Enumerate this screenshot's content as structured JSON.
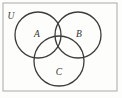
{
  "figure": {
    "kind": "venn-diagram",
    "title": "",
    "background_color": "#fdfdfb",
    "frame": {
      "label": "U",
      "label_name": "universal-set-label",
      "x": 3,
      "y": 3,
      "width": 114,
      "height": 88,
      "stroke_color": "#a9a9a9",
      "stroke_width": 1
    },
    "sets": [
      {
        "label": "A",
        "cx": 38,
        "cy": 35,
        "r": 23,
        "label_x": 37,
        "label_y": 37,
        "stroke_color": "#3c3c3c",
        "stroke_width": 1.3,
        "fill": "none"
      },
      {
        "label": "B",
        "cx": 78,
        "cy": 35,
        "r": 23,
        "label_x": 79,
        "label_y": 37,
        "stroke_color": "#3c3c3c",
        "stroke_width": 1.3,
        "fill": "none"
      },
      {
        "label": "C",
        "cx": 59,
        "cy": 61,
        "r": 25,
        "label_x": 59,
        "label_y": 75,
        "stroke_color": "#3c3c3c",
        "stroke_width": 1.3,
        "fill": "none"
      }
    ],
    "universe_label_pos": {
      "x": 11,
      "y": 19
    }
  }
}
